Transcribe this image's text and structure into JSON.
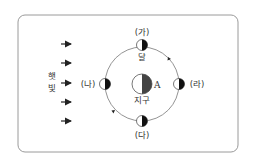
{
  "diagram": {
    "sunlight_label": "햇빛",
    "sunlight_chars": [
      "햇",
      "빛"
    ],
    "moon_label": "달",
    "earth_label": "지구",
    "earth_point_label": "A",
    "positions": [
      {
        "id": "ga",
        "label": "(가)"
      },
      {
        "id": "na",
        "label": "(나)"
      },
      {
        "id": "da",
        "label": "(다)"
      },
      {
        "id": "ra",
        "label": "(라)"
      }
    ],
    "orbit_direction": "counterclockwise",
    "colors": {
      "border": "#9a9a9a",
      "line": "#555555",
      "shadow": "#222222"
    }
  }
}
